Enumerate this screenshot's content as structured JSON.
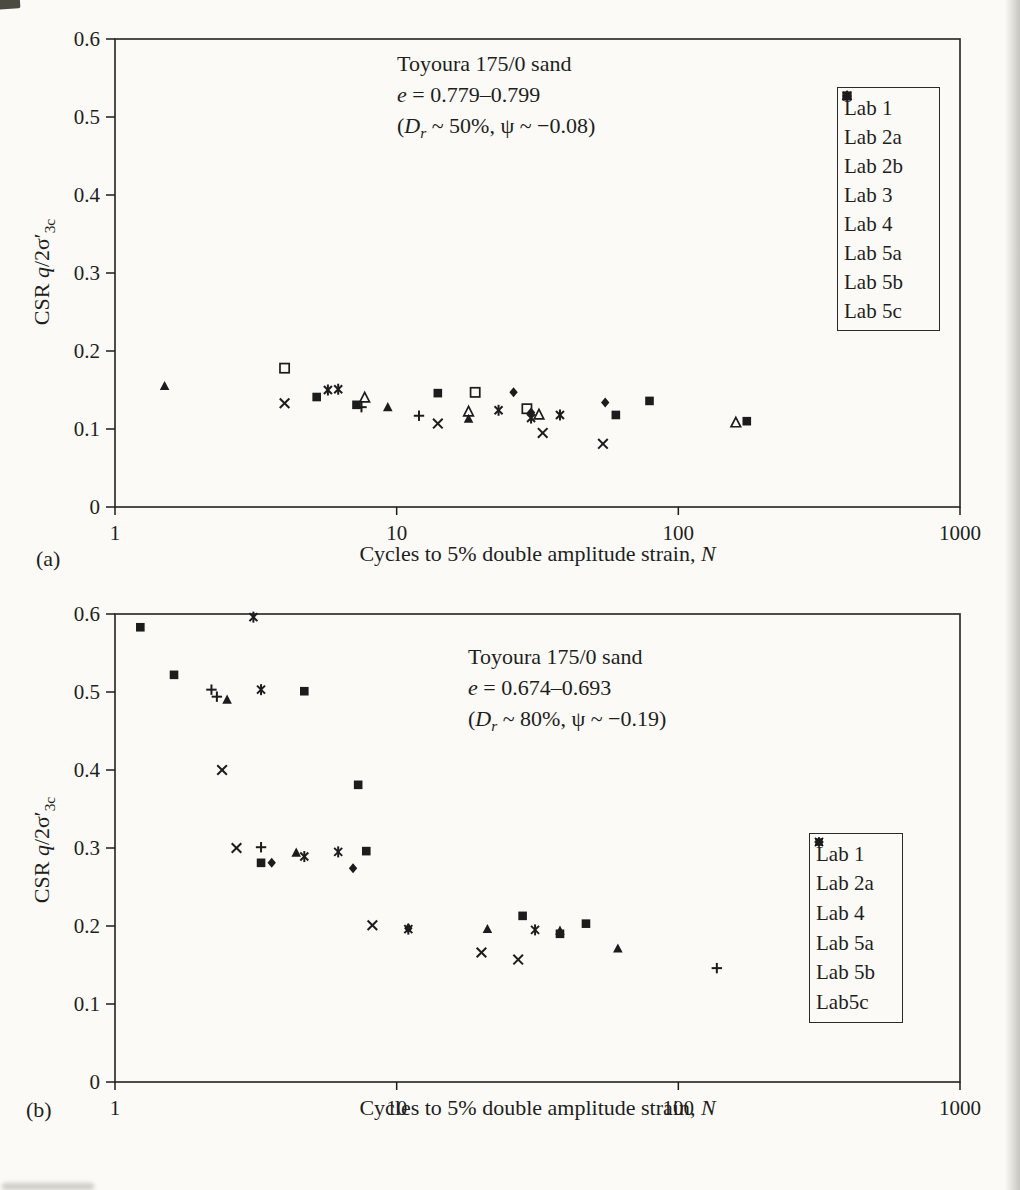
{
  "page": {
    "background": "#fbfaf6",
    "ink": "#1c1c1c",
    "frame_color": "#2e2e2e"
  },
  "chart_data": [
    {
      "id": "a",
      "type": "scatter",
      "panel_label": "(a)",
      "xscale": "log",
      "xlim": [
        1,
        1000
      ],
      "ylim": [
        0,
        0.6
      ],
      "xticks": [
        "1",
        "10",
        "100",
        "1000"
      ],
      "yticks": [
        "0",
        "0.1",
        "0.2",
        "0.3",
        "0.4",
        "0.5",
        "0.6"
      ],
      "xlabel_html": "Cycles to 5% double amplitude strain, <i>N</i>",
      "ylabel_html": "CSR <i>q</i>/2σ′<sub>3c</sub>",
      "annotation_html": [
        "Toyoura 175/0 sand",
        "<i>e</i> = 0.779–0.799",
        "(<i>D</i><sub><i>r</i></sub> ~ 50%, ψ ~ −0.08)"
      ],
      "legend_position": "right-top",
      "grid": false,
      "series": [
        {
          "name": "Lab 1",
          "legend_label": "Lab 1",
          "marker": "filled-diamond",
          "points": [
            [
              26,
              0.147
            ],
            [
              30,
              0.121
            ],
            [
              55,
              0.134
            ]
          ]
        },
        {
          "name": "Lab 2a",
          "legend_label": "Lab 2a",
          "marker": "filled-square",
          "points": [
            [
              5.2,
              0.141
            ],
            [
              7.2,
              0.131
            ],
            [
              14,
              0.146
            ],
            [
              60,
              0.118
            ],
            [
              79,
              0.136
            ],
            [
              175,
              0.11
            ]
          ]
        },
        {
          "name": "Lab 2b",
          "legend_label": "Lab 2b",
          "marker": "open-triangle",
          "points": [
            [
              7.7,
              0.14
            ],
            [
              18,
              0.122
            ],
            [
              32,
              0.118
            ],
            [
              160,
              0.108
            ]
          ]
        },
        {
          "name": "Lab 3",
          "legend_label": "Lab 3",
          "marker": "open-square",
          "points": [
            [
              4.0,
              0.178
            ],
            [
              19,
              0.147
            ],
            [
              29,
              0.126
            ]
          ]
        },
        {
          "name": "Lab 4",
          "legend_label": "Lab 4",
          "marker": "x-cross",
          "points": [
            [
              4.0,
              0.133
            ],
            [
              14,
              0.107
            ],
            [
              33,
              0.095
            ],
            [
              54,
              0.081
            ]
          ]
        },
        {
          "name": "Lab 5a",
          "legend_label": "Lab 5a",
          "marker": "asterisk",
          "points": [
            [
              5.7,
              0.15
            ],
            [
              6.2,
              0.151
            ],
            [
              23,
              0.124
            ],
            [
              30,
              0.114
            ],
            [
              38,
              0.118
            ]
          ]
        },
        {
          "name": "Lab 5b",
          "legend_label": "Lab 5b",
          "marker": "filled-triangle",
          "points": [
            [
              1.5,
              0.155
            ],
            [
              9.3,
              0.128
            ],
            [
              18,
              0.113
            ]
          ]
        },
        {
          "name": "Lab 5c",
          "legend_label": "Lab 5c",
          "marker": "plus",
          "points": [
            [
              7.5,
              0.128
            ],
            [
              12,
              0.117
            ]
          ]
        }
      ]
    },
    {
      "id": "b",
      "type": "scatter",
      "panel_label": "(b)",
      "xscale": "log",
      "xlim": [
        1,
        1000
      ],
      "ylim": [
        0,
        0.6
      ],
      "xticks": [
        "1",
        "10",
        "100",
        "1000"
      ],
      "yticks": [
        "0",
        "0.1",
        "0.2",
        "0.3",
        "0.4",
        "0.5",
        "0.6"
      ],
      "xlabel_html": "Cycles to 5% double amplitude strain, <i>N</i>",
      "ylabel_html": "CSR <i>q</i>/2σ′<sub>3c</sub>",
      "annotation_html": [
        "Toyoura 175/0 sand",
        "<i>e</i> = 0.674–0.693",
        "(<i>D</i><sub><i>r</i></sub> ~ 80%, ψ ~ −0.19)"
      ],
      "legend_position": "right-middle",
      "grid": false,
      "series": [
        {
          "name": "Lab 1",
          "legend_label": "Lab 1",
          "marker": "filled-diamond",
          "points": [
            [
              3.6,
              0.281
            ],
            [
              7.0,
              0.274
            ],
            [
              11,
              0.197
            ]
          ]
        },
        {
          "name": "Lab 2a",
          "legend_label": "Lab 2a",
          "marker": "filled-square",
          "points": [
            [
              1.23,
              0.583
            ],
            [
              1.62,
              0.522
            ],
            [
              3.3,
              0.281
            ],
            [
              4.7,
              0.501
            ],
            [
              7.3,
              0.381
            ],
            [
              7.8,
              0.296
            ],
            [
              28,
              0.213
            ],
            [
              38,
              0.19
            ],
            [
              47,
              0.203
            ]
          ]
        },
        {
          "name": "Lab 4",
          "legend_label": "Lab 4",
          "marker": "x-cross",
          "points": [
            [
              2.4,
              0.4
            ],
            [
              2.7,
              0.3
            ],
            [
              8.2,
              0.201
            ],
            [
              20,
              0.166
            ],
            [
              27,
              0.157
            ]
          ]
        },
        {
          "name": "Lab 5a",
          "legend_label": "Lab 5a",
          "marker": "asterisk",
          "points": [
            [
              3.1,
              0.596
            ],
            [
              3.3,
              0.503
            ],
            [
              4.7,
              0.289
            ],
            [
              6.2,
              0.295
            ],
            [
              11,
              0.196
            ],
            [
              31,
              0.195
            ]
          ]
        },
        {
          "name": "Lab 5b",
          "legend_label": "Lab 5b",
          "marker": "filled-triangle",
          "points": [
            [
              2.5,
              0.49
            ],
            [
              4.4,
              0.294
            ],
            [
              21,
              0.196
            ],
            [
              38,
              0.194
            ],
            [
              61,
              0.171
            ]
          ]
        },
        {
          "name": "Lab 5c",
          "legend_label": "Lab5c",
          "marker": "plus",
          "points": [
            [
              2.2,
              0.503
            ],
            [
              2.3,
              0.494
            ],
            [
              3.3,
              0.301
            ],
            [
              137,
              0.146
            ]
          ]
        }
      ]
    }
  ]
}
